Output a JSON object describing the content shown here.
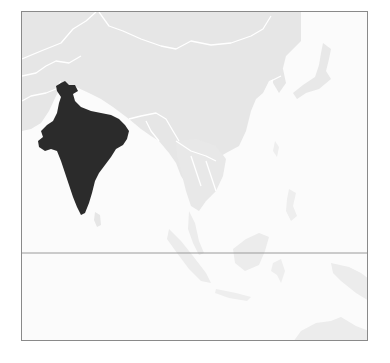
{
  "map": {
    "region": "South and East Asia",
    "highlighted_country": "India",
    "colors": {
      "highlight": "#2b2b2b",
      "land": "#e6e6e6",
      "land_faint": "#eeeeee",
      "borders": "#ffffff",
      "ocean": "#fbfbfb",
      "frame": "#8a8a8a",
      "equator": "#9a9a9a"
    },
    "lines": [
      "equator"
    ]
  }
}
